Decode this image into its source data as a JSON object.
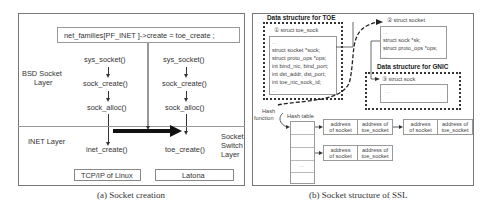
{
  "figure_a": {
    "caption": "(a) Socket creation",
    "assignment": "net_families[PF_INET   ]->create =  toe_create ;",
    "layers": {
      "bsd": [
        "BSD Socket",
        "Layer"
      ],
      "inet": "INET Layer",
      "switch": [
        "Socket",
        "Switch",
        "Layer"
      ]
    },
    "left_column": {
      "calls": [
        "sys_socket()",
        "sock_create()",
        "sock_alloc()",
        "inet_create()"
      ],
      "stack_label": "TCP/IP of Linux"
    },
    "right_column": {
      "calls": [
        "sys_socket()",
        "sock_create()",
        "sock_alloc()",
        "toe_create()"
      ],
      "stack_label": "Latona"
    }
  },
  "figure_b": {
    "caption": "(b) Socket structure of SSL",
    "toe_group": {
      "title": "Data structure for TOE",
      "struct_title": "① struct toe_sock",
      "fields": [
        "...",
        "struct socket *sock;",
        "struct proto_ops *ops;",
        "int bind_nic, bind_port;",
        "int dst_addr, dst_port;",
        "int toe_nic_sock_id;",
        "..."
      ]
    },
    "socket_struct": {
      "title": "② struct socket",
      "fields": [
        "...",
        "struct sock *sk;",
        "struct proto_ops *ops;",
        "..."
      ]
    },
    "gnic_group": {
      "title": "Data structure for GNIC",
      "struct_title": "③ struct sock",
      "fields": [
        "..."
      ]
    },
    "hash": {
      "function_label": [
        "Hash",
        "function"
      ],
      "table_label": "Hash table",
      "ellipsis": "...",
      "entries": [
        {
          "addr_socket": [
            "address",
            "of socket"
          ],
          "addr_toe": [
            "address of",
            "toe_socket"
          ]
        },
        {
          "addr_socket": [
            "address",
            "of socket"
          ],
          "addr_toe": [
            "address of",
            "toe_socket"
          ]
        },
        {
          "addr_socket": [
            "address",
            "of socket"
          ],
          "addr_toe": [
            "address of",
            "toe_socket"
          ]
        }
      ]
    }
  }
}
